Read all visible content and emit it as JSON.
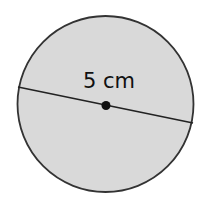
{
  "diagram": {
    "shape": "circle",
    "fill_color": "#d9d9d9",
    "stroke_color": "#333333",
    "measurement_label": "5 cm",
    "measurement_type": "diameter",
    "center_point": true
  }
}
